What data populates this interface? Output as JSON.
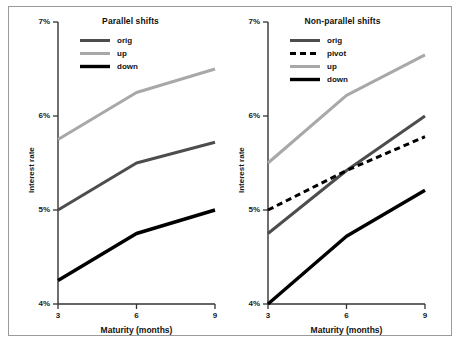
{
  "figure": {
    "background": "#ffffff",
    "border_color": "#9a9a9a"
  },
  "colors": {
    "orig": "#4d4d4d",
    "pivot": "#000000",
    "up": "#a8a8a8",
    "down": "#000000",
    "axis": "#333333",
    "text": "#1a1a1a"
  },
  "axis": {
    "xlabel": "Maturity (months)",
    "ylabel": "Interest rate",
    "xticks": [
      "3",
      "6",
      "9"
    ],
    "yticks": [
      "7%",
      "6%",
      "5%",
      "4%"
    ]
  },
  "panels": [
    {
      "id": "parallel",
      "title": "Parallel shifts",
      "legend": [
        {
          "label": "orig",
          "color": "#4d4d4d",
          "style": "solid",
          "width": 3.0
        },
        {
          "label": "up",
          "color": "#a8a8a8",
          "style": "solid",
          "width": 3.0
        },
        {
          "label": "down",
          "color": "#000000",
          "style": "solid",
          "width": 3.4
        }
      ]
    },
    {
      "id": "non-parallel",
      "title": "Non-parallel shifts",
      "legend": [
        {
          "label": "orig",
          "color": "#4d4d4d",
          "style": "solid",
          "width": 3.0
        },
        {
          "label": "pivot",
          "color": "#000000",
          "style": "dashed",
          "width": 3.0
        },
        {
          "label": "up",
          "color": "#a8a8a8",
          "style": "solid",
          "width": 3.0
        },
        {
          "label": "down",
          "color": "#000000",
          "style": "solid",
          "width": 3.4
        }
      ]
    }
  ],
  "chart_data": [
    {
      "type": "line",
      "title": "Parallel shifts",
      "xlabel": "Maturity (months)",
      "ylabel": "Interest rate",
      "x": [
        3,
        6,
        9
      ],
      "xlim": [
        3,
        9
      ],
      "ylim": [
        4,
        7
      ],
      "xticks": [
        3,
        6,
        9
      ],
      "yticks": [
        4,
        5,
        6,
        7
      ],
      "ytick_labels": [
        "4%",
        "5%",
        "6%",
        "7%"
      ],
      "grid": false,
      "legend_position": "upper left",
      "series": [
        {
          "name": "orig",
          "values": [
            5.0,
            5.5,
            5.72
          ],
          "color": "#4d4d4d",
          "style": "solid"
        },
        {
          "name": "up",
          "values": [
            5.75,
            6.25,
            6.5
          ],
          "color": "#a8a8a8",
          "style": "solid"
        },
        {
          "name": "down",
          "values": [
            4.25,
            4.75,
            5.0
          ],
          "color": "#000000",
          "style": "solid"
        }
      ]
    },
    {
      "type": "line",
      "title": "Non-parallel shifts",
      "xlabel": "Maturity (months)",
      "ylabel": "Interest rate",
      "x": [
        3,
        6,
        9
      ],
      "xlim": [
        3,
        9
      ],
      "ylim": [
        4,
        7
      ],
      "xticks": [
        3,
        6,
        9
      ],
      "yticks": [
        4,
        5,
        6,
        7
      ],
      "ytick_labels": [
        "4%",
        "5%",
        "6%",
        "7%"
      ],
      "grid": false,
      "legend_position": "upper left",
      "series": [
        {
          "name": "orig",
          "values": [
            4.75,
            5.42,
            6.0
          ],
          "color": "#4d4d4d",
          "style": "solid"
        },
        {
          "name": "pivot",
          "values": [
            5.0,
            5.42,
            5.78
          ],
          "color": "#000000",
          "style": "dashed"
        },
        {
          "name": "up",
          "values": [
            5.5,
            6.22,
            6.65
          ],
          "color": "#a8a8a8",
          "style": "solid"
        },
        {
          "name": "down",
          "values": [
            4.0,
            4.72,
            5.21
          ],
          "color": "#000000",
          "style": "solid"
        }
      ]
    }
  ]
}
